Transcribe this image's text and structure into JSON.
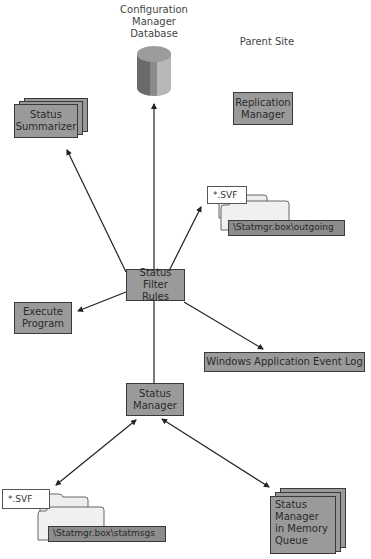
{
  "diagram": {
    "site_label": "Parent Site",
    "nodes": {
      "database": {
        "label": "Configuration Manager Database",
        "lines": [
          "Configuration",
          "Manager",
          "Database"
        ]
      },
      "replication_manager": {
        "lines": [
          "Replication",
          "Manager"
        ]
      },
      "status_summarizer": {
        "lines": [
          "Status",
          "Summarizer"
        ]
      },
      "status_filter_rules": {
        "lines": [
          "Status Filter",
          "Rules"
        ]
      },
      "execute_program": {
        "lines": [
          "Execute",
          "Program"
        ]
      },
      "windows_event_log": {
        "label": "Windows Application Event Log"
      },
      "status_manager": {
        "lines": [
          "Status",
          "Manager"
        ]
      },
      "memory_queue": {
        "lines": [
          "Status",
          "Manager",
          "in Memory",
          "Queue"
        ]
      },
      "outgoing_folder": {
        "file_label": "*.SVF",
        "path": "\\Statmgr.box\\outgoing"
      },
      "statmsgs_folder": {
        "file_label": "*.SVF",
        "path": "\\Statmgr.box\\statmsgs"
      }
    },
    "edges": [
      {
        "from": "status_filter_rules",
        "to": "database",
        "direction": "to"
      },
      {
        "from": "status_filter_rules",
        "to": "status_summarizer",
        "direction": "to"
      },
      {
        "from": "status_filter_rules",
        "to": "outgoing_folder",
        "direction": "to"
      },
      {
        "from": "status_filter_rules",
        "to": "execute_program",
        "direction": "to"
      },
      {
        "from": "status_filter_rules",
        "to": "windows_event_log",
        "direction": "to"
      },
      {
        "from": "status_manager",
        "to": "status_filter_rules",
        "direction": "none"
      },
      {
        "from": "status_manager",
        "to": "statmsgs_folder",
        "direction": "both"
      },
      {
        "from": "status_manager",
        "to": "memory_queue",
        "direction": "both"
      }
    ],
    "colors": {
      "box_fill": "#9a9a9a",
      "box_border": "#3a3a3a",
      "line": "#222222"
    }
  }
}
